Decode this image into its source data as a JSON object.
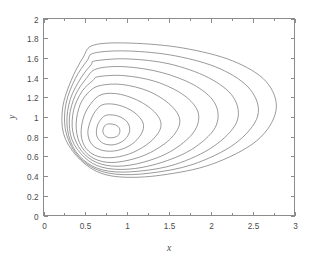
{
  "chart_data": {
    "type": "line",
    "subtype": "contour",
    "title": "",
    "xlabel": "x",
    "ylabel": "y",
    "xlim": [
      0,
      3
    ],
    "ylim": [
      0,
      2
    ],
    "grid": false,
    "legend": null,
    "x_ticks": [
      0,
      0.5,
      1,
      1.5,
      2,
      2.5,
      3
    ],
    "x_tick_labels": [
      "0",
      "0.5",
      "1",
      "1.5",
      "2",
      "2.5",
      "3"
    ],
    "x_minor_ticks": [
      0.25,
      0.75,
      1.25,
      1.75,
      2.25,
      2.75
    ],
    "y_ticks": [
      0,
      0.2,
      0.4,
      0.6,
      0.8,
      1,
      1.2,
      1.4,
      1.6,
      1.8,
      2
    ],
    "y_tick_labels": [
      "0",
      "0.2",
      "0.4",
      "0.6",
      "0.8",
      "1",
      "1.2",
      "1.4",
      "1.6",
      "1.8",
      "2"
    ],
    "line_color": "#6e6e6e",
    "axis_color": "#8c8c8c",
    "background_color": "#ffffff",
    "center": [
      0.82,
      0.86
    ],
    "n_contours": 10,
    "contours": [
      {
        "level": 1,
        "points": [
          [
            0.78,
            0.93
          ],
          [
            0.86,
            0.92
          ],
          [
            0.91,
            0.88
          ],
          [
            0.9,
            0.82
          ],
          [
            0.83,
            0.79
          ],
          [
            0.75,
            0.8
          ],
          [
            0.71,
            0.85
          ],
          [
            0.73,
            0.91
          ],
          [
            0.78,
            0.93
          ]
        ]
      },
      {
        "level": 2,
        "points": [
          [
            0.76,
            1.02
          ],
          [
            0.89,
            1.01
          ],
          [
            1.0,
            0.95
          ],
          [
            1.03,
            0.86
          ],
          [
            0.97,
            0.77
          ],
          [
            0.85,
            0.72
          ],
          [
            0.72,
            0.73
          ],
          [
            0.64,
            0.8
          ],
          [
            0.64,
            0.9
          ],
          [
            0.69,
            0.98
          ],
          [
            0.76,
            1.02
          ]
        ]
      },
      {
        "level": 3,
        "points": [
          [
            0.73,
            1.13
          ],
          [
            0.9,
            1.12
          ],
          [
            1.08,
            1.05
          ],
          [
            1.19,
            0.94
          ],
          [
            1.17,
            0.83
          ],
          [
            1.05,
            0.72
          ],
          [
            0.88,
            0.66
          ],
          [
            0.71,
            0.66
          ],
          [
            0.58,
            0.72
          ],
          [
            0.53,
            0.84
          ],
          [
            0.57,
            0.98
          ],
          [
            0.64,
            1.08
          ],
          [
            0.73,
            1.13
          ]
        ]
      },
      {
        "level": 4,
        "points": [
          [
            0.7,
            1.23
          ],
          [
            0.92,
            1.23
          ],
          [
            1.17,
            1.15
          ],
          [
            1.36,
            1.02
          ],
          [
            1.4,
            0.89
          ],
          [
            1.28,
            0.75
          ],
          [
            1.07,
            0.64
          ],
          [
            0.85,
            0.59
          ],
          [
            0.65,
            0.6
          ],
          [
            0.51,
            0.68
          ],
          [
            0.45,
            0.82
          ],
          [
            0.48,
            1.0
          ],
          [
            0.57,
            1.14
          ],
          [
            0.7,
            1.23
          ]
        ]
      },
      {
        "level": 5,
        "points": [
          [
            0.68,
            1.32
          ],
          [
            0.94,
            1.33
          ],
          [
            1.26,
            1.26
          ],
          [
            1.52,
            1.12
          ],
          [
            1.63,
            0.96
          ],
          [
            1.53,
            0.79
          ],
          [
            1.28,
            0.64
          ],
          [
            1.01,
            0.56
          ],
          [
            0.76,
            0.54
          ],
          [
            0.56,
            0.6
          ],
          [
            0.43,
            0.74
          ],
          [
            0.39,
            0.93
          ],
          [
            0.44,
            1.13
          ],
          [
            0.55,
            1.26
          ],
          [
            0.68,
            1.32
          ]
        ]
      },
      {
        "level": 6,
        "points": [
          [
            0.66,
            1.41
          ],
          [
            0.96,
            1.42
          ],
          [
            1.34,
            1.36
          ],
          [
            1.68,
            1.22
          ],
          [
            1.85,
            1.04
          ],
          [
            1.79,
            0.84
          ],
          [
            1.52,
            0.65
          ],
          [
            1.19,
            0.54
          ],
          [
            0.88,
            0.5
          ],
          [
            0.63,
            0.54
          ],
          [
            0.45,
            0.66
          ],
          [
            0.35,
            0.85
          ],
          [
            0.36,
            1.07
          ],
          [
            0.46,
            1.26
          ],
          [
            0.59,
            1.37
          ],
          [
            0.66,
            1.41
          ]
        ]
      },
      {
        "level": 7,
        "points": [
          [
            0.64,
            1.49
          ],
          [
            0.98,
            1.51
          ],
          [
            1.42,
            1.45
          ],
          [
            1.83,
            1.31
          ],
          [
            2.06,
            1.12
          ],
          [
            2.05,
            0.89
          ],
          [
            1.77,
            0.67
          ],
          [
            1.38,
            0.53
          ],
          [
            1.01,
            0.47
          ],
          [
            0.7,
            0.49
          ],
          [
            0.49,
            0.59
          ],
          [
            0.34,
            0.77
          ],
          [
            0.31,
            1.0
          ],
          [
            0.38,
            1.22
          ],
          [
            0.51,
            1.39
          ],
          [
            0.64,
            1.49
          ]
        ]
      },
      {
        "level": 8,
        "points": [
          [
            0.62,
            1.57
          ],
          [
            1.0,
            1.59
          ],
          [
            1.5,
            1.54
          ],
          [
            1.97,
            1.4
          ],
          [
            2.27,
            1.2
          ],
          [
            2.31,
            0.95
          ],
          [
            2.03,
            0.7
          ],
          [
            1.58,
            0.52
          ],
          [
            1.14,
            0.45
          ],
          [
            0.78,
            0.45
          ],
          [
            0.53,
            0.53
          ],
          [
            0.35,
            0.7
          ],
          [
            0.28,
            0.93
          ],
          [
            0.32,
            1.18
          ],
          [
            0.45,
            1.4
          ],
          [
            0.57,
            1.53
          ],
          [
            0.62,
            1.57
          ]
        ]
      },
      {
        "level": 9,
        "points": [
          [
            0.61,
            1.65
          ],
          [
            1.02,
            1.67
          ],
          [
            1.58,
            1.62
          ],
          [
            2.11,
            1.49
          ],
          [
            2.47,
            1.28
          ],
          [
            2.56,
            1.01
          ],
          [
            2.29,
            0.73
          ],
          [
            1.79,
            0.52
          ],
          [
            1.27,
            0.43
          ],
          [
            0.86,
            0.42
          ],
          [
            0.58,
            0.49
          ],
          [
            0.37,
            0.65
          ],
          [
            0.26,
            0.88
          ],
          [
            0.27,
            1.14
          ],
          [
            0.38,
            1.39
          ],
          [
            0.52,
            1.57
          ],
          [
            0.61,
            1.65
          ]
        ]
      },
      {
        "level": 10,
        "points": [
          [
            0.6,
            1.73
          ],
          [
            1.05,
            1.75
          ],
          [
            1.67,
            1.7
          ],
          [
            2.26,
            1.57
          ],
          [
            2.66,
            1.36
          ],
          [
            2.78,
            1.07
          ],
          [
            2.55,
            0.76
          ],
          [
            2.01,
            0.52
          ],
          [
            1.41,
            0.41
          ],
          [
            0.94,
            0.39
          ],
          [
            0.63,
            0.45
          ],
          [
            0.39,
            0.61
          ],
          [
            0.24,
            0.83
          ],
          [
            0.23,
            1.1
          ],
          [
            0.33,
            1.37
          ],
          [
            0.47,
            1.6
          ],
          [
            0.6,
            1.73
          ]
        ]
      }
    ]
  },
  "figure": {
    "name": "contour-plot"
  }
}
